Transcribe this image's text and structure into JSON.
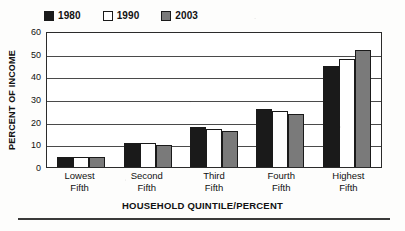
{
  "chart_data": {
    "type": "bar",
    "title": "",
    "subtitle": "",
    "xlabel": "HOUSEHOLD QUINTILE/PERCENT",
    "ylabel": "PERCENT OF INCOME",
    "categories": [
      "Lowest Fifth",
      "Second Fifth",
      "Third Fifth",
      "Fourth Fifth",
      "Highest Fifth"
    ],
    "category_lines": [
      [
        "Lowest",
        "Fifth"
      ],
      [
        "Second",
        "Fifth"
      ],
      [
        "Third",
        "Fifth"
      ],
      [
        "Fourth",
        "Fifth"
      ],
      [
        "Highest",
        "Fifth"
      ]
    ],
    "series": [
      {
        "name": "1980",
        "color": "#1a1a1a",
        "values": [
          4.3,
          10.8,
          17.6,
          25.5,
          44.5
        ]
      },
      {
        "name": "1990",
        "color": "#ffffff",
        "values": [
          4.4,
          10.5,
          16.6,
          24.5,
          47.5
        ]
      },
      {
        "name": "2003",
        "color": "#7a7a7a",
        "values": [
          4.2,
          9.6,
          15.8,
          23.5,
          51.5
        ]
      }
    ],
    "ylim": [
      0,
      60
    ],
    "yticks": [
      0,
      10,
      20,
      30,
      40,
      50,
      60
    ],
    "ytick_labels": [
      "0",
      "10",
      "20",
      "30",
      "40",
      "50",
      "60"
    ],
    "xlim_categories": 5,
    "grid": true,
    "grid_axis": "y",
    "legend_position": "top-left"
  },
  "legend": {
    "entries": [
      {
        "label": "1980",
        "swatch": "filled-black-square"
      },
      {
        "label": "1990",
        "swatch": "outlined-white-square"
      },
      {
        "label": "2003",
        "swatch": "filled-gray-square"
      }
    ]
  },
  "colors": {
    "series_1980": "#1a1a1a",
    "series_1990": "#ffffff",
    "series_2003": "#7a7a7a",
    "axis": "#2b2b2b",
    "gridline": "#4a4a4a",
    "background": "#ffffff"
  }
}
